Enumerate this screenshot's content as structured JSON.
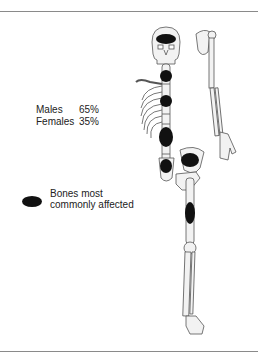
{
  "figure": {
    "stats": [
      {
        "label": "Males",
        "value": "65%"
      },
      {
        "label": "Females",
        "value": "35%"
      }
    ],
    "legend": {
      "line1": "Bones most",
      "line2": "commonly affected",
      "swatch_color": "#111111"
    },
    "illustration": "skeleton-with-affected-bones",
    "affected_sites": [
      "skull",
      "cervical-spine",
      "thoracic-spine",
      "lumbar-spine",
      "sacrum",
      "pelvis-ilium",
      "femur"
    ],
    "colors": {
      "bone_fill": "#f2f2f2",
      "bone_stroke": "#555555",
      "lesion": "#111111",
      "rule": "#8a8a8a"
    }
  }
}
